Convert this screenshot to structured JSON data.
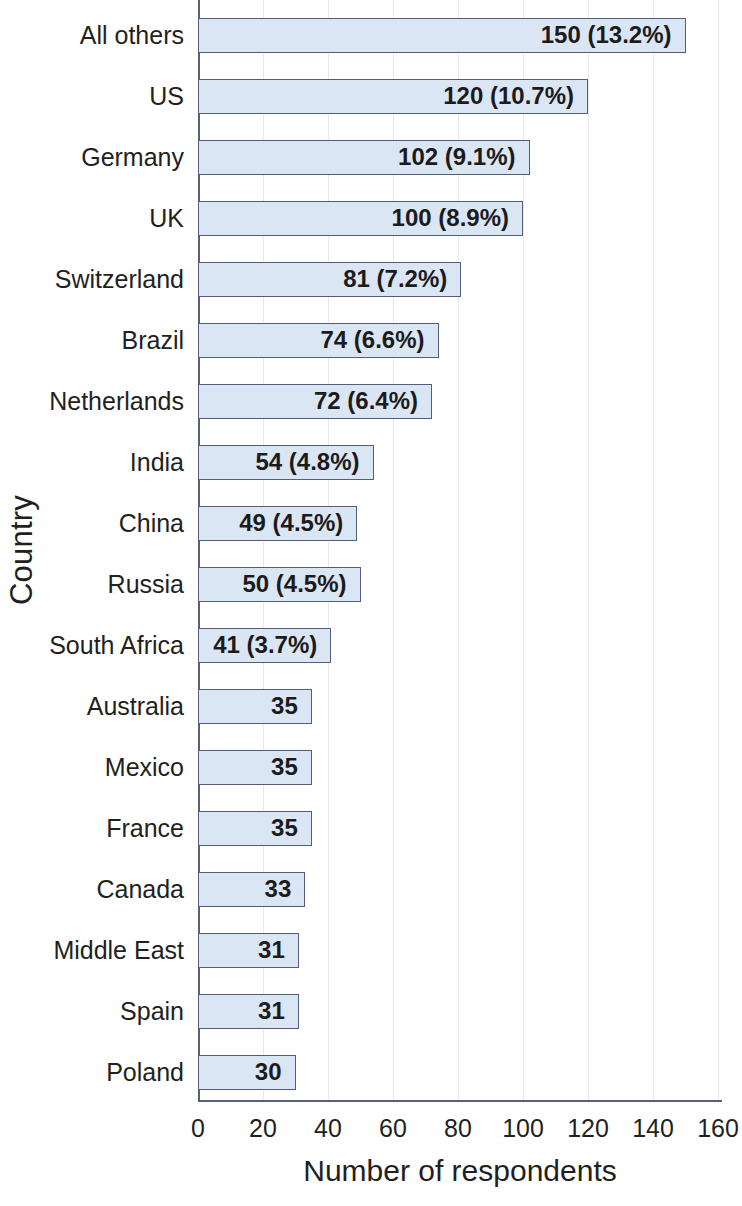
{
  "chart_data": {
    "type": "bar",
    "orientation": "horizontal",
    "title": "",
    "xlabel": "Number of respondents",
    "ylabel": "Country",
    "xlim": [
      0,
      160
    ],
    "xticks": [
      "0",
      "20",
      "40",
      "60",
      "80",
      "100",
      "120",
      "140",
      "160"
    ],
    "xtick_values": [
      0,
      20,
      40,
      60,
      80,
      100,
      120,
      140,
      160
    ],
    "grid": "vertical",
    "legend": "none",
    "categories": [
      "All others",
      "US",
      "Germany",
      "UK",
      "Switzerland",
      "Brazil",
      "Netherlands",
      "India",
      "China",
      "Russia",
      "South Africa",
      "Australia",
      "Mexico",
      "France",
      "Canada",
      "Middle East",
      "Spain",
      "Poland"
    ],
    "values": [
      150,
      120,
      102,
      100,
      81,
      74,
      72,
      54,
      49,
      50,
      41,
      35,
      35,
      35,
      33,
      31,
      31,
      30
    ],
    "percentages": [
      "13.2%",
      "10.7%",
      "9.1%",
      "8.9%",
      "7.2%",
      "6.6%",
      "6.4%",
      "4.8%",
      "4.5%",
      "4.5%",
      "3.7%",
      "",
      "",
      "",
      "",
      "",
      "",
      ""
    ],
    "data_labels": [
      "150   (13.2%)",
      "120  (10.7%)",
      "102  (9.1%)",
      "100  (8.9%)",
      "81  (7.2%)",
      "74  (6.6%)",
      "72  (6.4%)",
      "54  (4.8%)",
      "49  (4.5%)",
      "50  (4.5%)",
      "41  (3.7%)",
      "35",
      "35",
      "35",
      "33",
      "31",
      "31",
      "30"
    ],
    "colors": {
      "bar_fill": "#dbe6f5",
      "bar_border": "#545d7d",
      "axis": "#5b6075",
      "grid": "#e9e9ea",
      "text": "#231f20",
      "background": "#ffffff"
    }
  }
}
